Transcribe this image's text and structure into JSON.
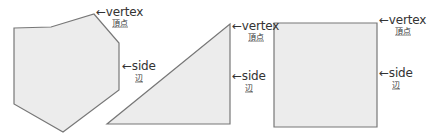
{
  "colors": {
    "shape_fill": "#ececec",
    "shape_stroke": "#777777",
    "text": "#333333"
  },
  "shapes": [
    {
      "name": "hexagon",
      "points": "14,28 51,27 94,14 119,43 119,90 63,132 14,104",
      "vertex_label": {
        "arrow": "←",
        "en": "vertex",
        "ja": "頂点"
      },
      "side_label": {
        "arrow": "←",
        "en": "side",
        "ja": "辺"
      }
    },
    {
      "name": "right-triangle",
      "points": "107,124 230,124 230,24",
      "vertex_label": {
        "arrow": "←",
        "en": "vertex",
        "ja": "頂点"
      },
      "side_label": {
        "arrow": "←",
        "en": "side",
        "ja": "辺"
      }
    },
    {
      "name": "square",
      "points": "274,23 377,23 377,127 274,127",
      "vertex_label": {
        "arrow": "←",
        "en": "vertex",
        "ja": "頂点"
      },
      "side_label": {
        "arrow": "←",
        "en": "side",
        "ja": "辺"
      }
    }
  ]
}
